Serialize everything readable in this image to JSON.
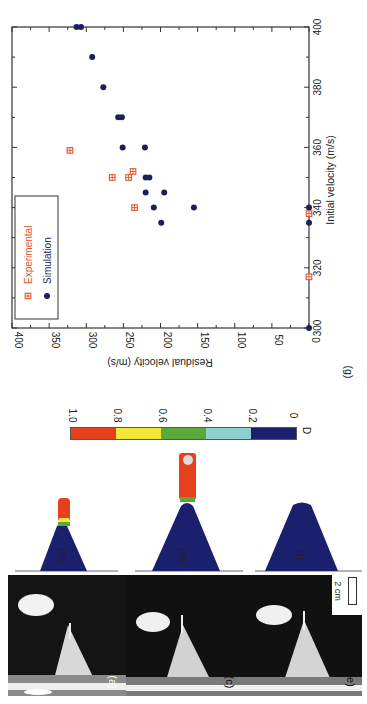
{
  "figure": {
    "orientation": "rotated 90deg clockwise",
    "panels": [
      {
        "id": "a",
        "label": "(a)",
        "kind": "photo"
      },
      {
        "id": "b",
        "label": "(b)",
        "kind": "simulation"
      },
      {
        "id": "c",
        "label": "(c)",
        "kind": "photo"
      },
      {
        "id": "d",
        "label": "(d)",
        "kind": "simulation"
      },
      {
        "id": "e",
        "label": "e)",
        "kind": "photo"
      },
      {
        "id": "f",
        "label": "(f)",
        "kind": "simulation"
      },
      {
        "id": "g",
        "label": "(g)",
        "kind": "chart"
      }
    ],
    "scale_bar": {
      "label": "2 cm"
    },
    "colorbar": {
      "title": "D",
      "ticks": [
        "1.0",
        "0.8",
        "0.6",
        "0.4",
        "0.2",
        "0"
      ],
      "segments": [
        {
          "from": 0.8,
          "to": 1.0,
          "color": "#e8401c"
        },
        {
          "from": 0.6,
          "to": 0.8,
          "color": "#f2e83a"
        },
        {
          "from": 0.4,
          "to": 0.6,
          "color": "#5aaa3a"
        },
        {
          "from": 0.2,
          "to": 0.4,
          "color": "#8ecfcf"
        },
        {
          "from": 0.0,
          "to": 0.2,
          "color": "#1a1f6e"
        }
      ]
    }
  },
  "chart_data": {
    "type": "scatter",
    "title": "",
    "panel_label": "(g)",
    "xlabel": "Initial velocity (m/s)",
    "ylabel": "Residual velocity (m/s)",
    "xlim": [
      300,
      400
    ],
    "ylim": [
      0,
      400
    ],
    "x_ticks": [
      "300",
      "320",
      "340",
      "360",
      "380",
      "400"
    ],
    "y_ticks": [
      "0",
      "50",
      "100",
      "150",
      "200",
      "250",
      "300",
      "350",
      "400"
    ],
    "grid": false,
    "legend_position": "upper left (rotated)",
    "series": [
      {
        "name": "Experimental",
        "marker": "square-with-cross",
        "color": "#e0552a",
        "points": [
          [
            359,
            322
          ],
          [
            350,
            265
          ],
          [
            350,
            243
          ],
          [
            352,
            237
          ],
          [
            340,
            235
          ],
          [
            338,
            0
          ],
          [
            317,
            0
          ]
        ]
      },
      {
        "name": "Simulation",
        "marker": "filled-circle",
        "color": "#1b1f5e",
        "points": [
          [
            400,
            313
          ],
          [
            400,
            307
          ],
          [
            390,
            292
          ],
          [
            380,
            277
          ],
          [
            370,
            257
          ],
          [
            370,
            252
          ],
          [
            360,
            251
          ],
          [
            360,
            221
          ],
          [
            350,
            220
          ],
          [
            350,
            215
          ],
          [
            345,
            220
          ],
          [
            345,
            195
          ],
          [
            340,
            209
          ],
          [
            340,
            155
          ],
          [
            335,
            199
          ],
          [
            340,
            0
          ],
          [
            335,
            0
          ],
          [
            300,
            0
          ]
        ]
      }
    ]
  }
}
